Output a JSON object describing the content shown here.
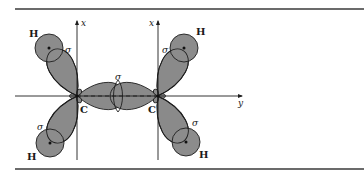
{
  "figure": {
    "colors": {
      "orbital_fill": "#8a8a8a",
      "hydrogen_fill": "#8c8c8c",
      "outline": "#1e1e1e",
      "rule": "#3a3a3a",
      "background": "#ffffff"
    },
    "axes": {
      "left_x_label": "x",
      "right_x_label": "x",
      "y_label": "y"
    },
    "atoms": {
      "carbon_left": "C",
      "carbon_right": "C",
      "h_upper_left": "H",
      "h_lower_left": "H",
      "h_upper_right": "H",
      "h_lower_right": "H"
    },
    "bonds": {
      "cc_sigma": "σ",
      "ch_upper_left_sigma": "σ",
      "ch_lower_left_sigma": "σ",
      "ch_upper_right_sigma": "σ",
      "ch_lower_right_sigma": "σ"
    }
  }
}
